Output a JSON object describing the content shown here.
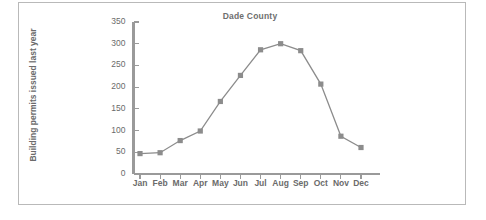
{
  "chart_data": {
    "type": "line",
    "title": "Dade County",
    "xlabel": "",
    "ylabel": "Building permits issued last year",
    "categories": [
      "Jan",
      "Feb",
      "Mar",
      "Apr",
      "May",
      "Jun",
      "Jul",
      "Aug",
      "Sep",
      "Oct",
      "Nov",
      "Dec"
    ],
    "values": [
      47,
      49,
      77,
      99,
      167,
      227,
      286,
      300,
      284,
      207,
      87,
      61
    ],
    "ylim": [
      0,
      350
    ],
    "yticks": [
      0,
      50,
      100,
      150,
      200,
      250,
      300,
      350
    ],
    "ytick_labels": [
      "0",
      "50",
      "100",
      "150",
      "200",
      "250",
      "300",
      "350"
    ],
    "grid": false,
    "legend": null,
    "marker": "square",
    "series_color": "#8c8c8c",
    "axis_color": "#9a9a9a",
    "text_color": "#6b6b6b",
    "frame_color": "#b9b9b9"
  }
}
